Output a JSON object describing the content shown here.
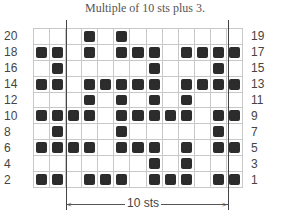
{
  "title": "Multiple of 10 sts plus 3.",
  "chart": {
    "columns": 13,
    "rows": 10,
    "repeat_label": "10 sts",
    "repeat_start_col": 3,
    "repeat_end_col": 12,
    "filled_color": "#2c2c2c",
    "grid_color": "#c8c8c8",
    "left_labels": [
      "20",
      "18",
      "16",
      "14",
      "12",
      "10",
      "8",
      "6",
      "4",
      "2"
    ],
    "right_labels": [
      "19",
      "17",
      "15",
      "13",
      "11",
      "9",
      "7",
      "5",
      "3",
      "1"
    ],
    "grid": [
      [
        0,
        0,
        0,
        1,
        0,
        1,
        0,
        0,
        0,
        0,
        0,
        0,
        0
      ],
      [
        1,
        1,
        0,
        1,
        0,
        1,
        1,
        1,
        0,
        1,
        1,
        1,
        1
      ],
      [
        0,
        1,
        0,
        0,
        0,
        0,
        0,
        1,
        0,
        0,
        0,
        1,
        0
      ],
      [
        1,
        1,
        0,
        1,
        1,
        1,
        1,
        1,
        0,
        1,
        1,
        1,
        1
      ],
      [
        0,
        0,
        0,
        1,
        0,
        1,
        0,
        1,
        0,
        1,
        0,
        0,
        0
      ],
      [
        1,
        1,
        1,
        1,
        0,
        1,
        1,
        1,
        1,
        1,
        0,
        1,
        1
      ],
      [
        0,
        1,
        0,
        0,
        0,
        1,
        0,
        0,
        0,
        0,
        0,
        1,
        0
      ],
      [
        1,
        1,
        1,
        1,
        0,
        1,
        1,
        1,
        0,
        1,
        0,
        1,
        1
      ],
      [
        0,
        0,
        0,
        0,
        0,
        0,
        0,
        1,
        0,
        1,
        0,
        0,
        0
      ],
      [
        1,
        1,
        0,
        1,
        1,
        1,
        0,
        1,
        1,
        1,
        0,
        1,
        1
      ]
    ]
  }
}
